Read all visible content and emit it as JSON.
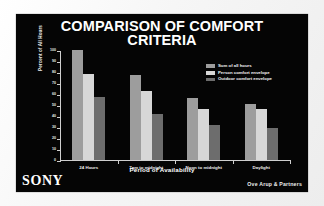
{
  "slide": {
    "title_line1": "COMPARISON OF COMFORT",
    "title_line2": "CRITERIA",
    "brand": "SONY",
    "credit": "Ove Arup & Partners",
    "background_color": "#050505",
    "title_color": "#ffffff"
  },
  "chart_data": {
    "type": "bar",
    "title": "COMPARISON OF COMFORT CRITERIA",
    "xlabel": "Period of Availability",
    "ylabel": "Percent of All Hours",
    "ylim": [
      0,
      100
    ],
    "yticks": [
      0,
      10,
      20,
      30,
      40,
      50,
      60,
      70,
      80,
      90,
      100
    ],
    "grid": false,
    "legend_position": "upper-right",
    "categories": [
      "24 Hours",
      "7am to midnight",
      "Noon to midnight",
      "Daylight"
    ],
    "series": [
      {
        "name": "Sum of all hours",
        "color": "#9d9d9d",
        "values": [
          100,
          77,
          56,
          51
        ]
      },
      {
        "name": "Person comfort envelope",
        "color": "#d7d7d7",
        "values": [
          78,
          63,
          46,
          46
        ]
      },
      {
        "name": "Outdoor comfort envelope",
        "color": "#6d6d6d",
        "values": [
          57,
          42,
          32,
          29
        ]
      }
    ]
  }
}
